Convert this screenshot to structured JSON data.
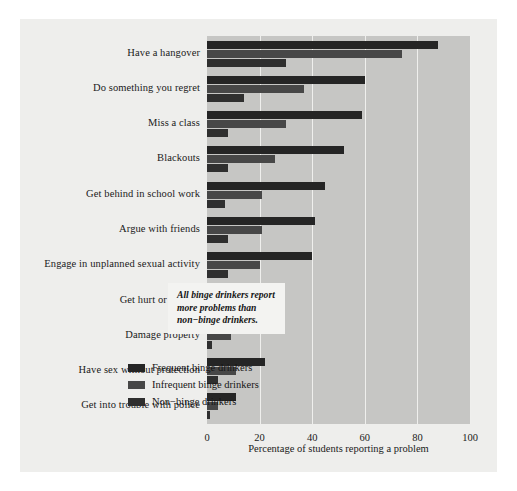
{
  "chart_data": {
    "type": "bar",
    "orientation": "horizontal",
    "title": "",
    "xlabel": "Percentage of students reporting a problem",
    "ylabel": "",
    "xlim": [
      0,
      100
    ],
    "xticks": [
      0,
      20,
      40,
      60,
      80,
      100
    ],
    "grid": true,
    "legend_position": "inside-right",
    "categories": [
      "Have a hangover",
      "Do something you regret",
      "Miss a class",
      "Blackouts",
      "Get behind in school work",
      "Argue with friends",
      "Engage in unplanned sexual activity",
      "Get hurt or injured",
      "Damage property",
      "Have sex without protection",
      "Get into trouble with police"
    ],
    "series": [
      {
        "name": "Frequent binge drinkers",
        "color": "#252525",
        "values": [
          88,
          60,
          59,
          52,
          45,
          41,
          40,
          22,
          22,
          22,
          11
        ]
      },
      {
        "name": "Infrequent binge drinkers",
        "color": "#474747",
        "values": [
          74,
          37,
          30,
          26,
          21,
          21,
          20,
          10,
          9,
          11,
          4
        ]
      },
      {
        "name": "Non−binge drinkers",
        "color": "#2f2f2f",
        "values": [
          30,
          14,
          8,
          8,
          7,
          8,
          8,
          2,
          2,
          4,
          1
        ]
      }
    ],
    "annotation": {
      "line1": "All binge drinkers report",
      "line2": "more problems than",
      "line3": "non−binge drinkers."
    }
  },
  "colors": {
    "figure_background": "#eeeeec",
    "plot_background": "#c6c6c4",
    "gridline": "#efefed",
    "annotation_background": "#f3f3f1",
    "text": "#1a1a1a"
  }
}
